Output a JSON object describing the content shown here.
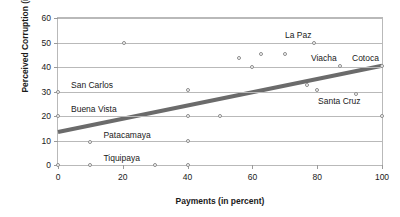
{
  "chart_data": {
    "type": "scatter",
    "title": "",
    "xlabel": "Payments (in percent)",
    "ylabel": "Perceived Corruption (in percent)",
    "xlim": [
      0,
      100
    ],
    "ylim": [
      0,
      60
    ],
    "xticks": [
      0,
      20,
      40,
      60,
      80,
      100
    ],
    "yticks": [
      0,
      10,
      20,
      30,
      40,
      50,
      60
    ],
    "grid": "horizontal",
    "legend": "none",
    "points": [
      {
        "x": 0,
        "y": 0
      },
      {
        "x": 0,
        "y": 20
      },
      {
        "x": 0,
        "y": 30
      },
      {
        "x": 10,
        "y": 0
      },
      {
        "x": 10,
        "y": 9.5
      },
      {
        "x": 20.5,
        "y": 50
      },
      {
        "x": 30,
        "y": 0
      },
      {
        "x": 40,
        "y": 0
      },
      {
        "x": 40,
        "y": 10
      },
      {
        "x": 40,
        "y": 20
      },
      {
        "x": 40,
        "y": 30.5
      },
      {
        "x": 50,
        "y": 20
      },
      {
        "x": 56,
        "y": 43.5
      },
      {
        "x": 60,
        "y": 40
      },
      {
        "x": 62.5,
        "y": 45.5
      },
      {
        "x": 70,
        "y": 45.5
      },
      {
        "x": 77,
        "y": 32.5
      },
      {
        "x": 79,
        "y": 50
      },
      {
        "x": 80,
        "y": 30.5
      },
      {
        "x": 87,
        "y": 40.5
      },
      {
        "x": 92,
        "y": 29
      },
      {
        "x": 100,
        "y": 20
      },
      {
        "x": 100,
        "y": 40.5
      }
    ],
    "annotations": [
      {
        "text": "La Paz",
        "x": 79,
        "y": 50,
        "anchor": "above-left"
      },
      {
        "text": "Viacha",
        "x": 87,
        "y": 40.5,
        "anchor": "above-left"
      },
      {
        "text": "Cotoca",
        "x": 100,
        "y": 40.5,
        "anchor": "above-left"
      },
      {
        "text": "Santa Cruz",
        "x": 92,
        "y": 29,
        "anchor": "below-left"
      },
      {
        "text": "San Carlos",
        "x": 0,
        "y": 30,
        "anchor": "above-right"
      },
      {
        "text": "Buena Vista",
        "x": 0,
        "y": 20,
        "anchor": "above-right"
      },
      {
        "text": "Patacamaya",
        "x": 10,
        "y": 9.5,
        "anchor": "above-right"
      },
      {
        "text": "Tiquipaya",
        "x": 10,
        "y": 0,
        "anchor": "above-right"
      }
    ],
    "trendline": {
      "type": "linear",
      "x0": 0,
      "y0": 13.5,
      "x1": 100,
      "y1": 40.5,
      "color": "#6b6b6b",
      "width_px": 4
    },
    "marker_color": "#8c8c8c",
    "grid_color": "#b9b9b9",
    "frame_color": "#b9b9b9",
    "text_color": "#1a1a1a"
  }
}
